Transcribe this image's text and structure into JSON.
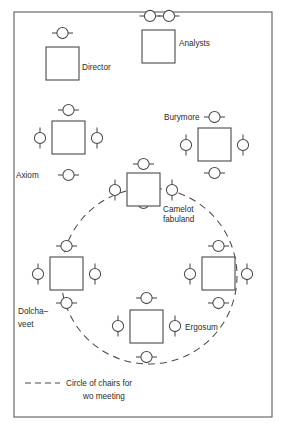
{
  "diagram": {
    "frame": {
      "x": 14,
      "y": 12,
      "width": 258,
      "height": 405
    },
    "colors": {
      "line": "#4a4a4a",
      "frame": "#5c5c5c",
      "text": "#2b2b2b",
      "background": "#ffffff"
    },
    "symbols": {
      "desk": "desk-square",
      "chair": "chair-circle-with-bar",
      "meeting_circle": "dashed-circle"
    },
    "meeting_circle": {
      "cx": 149,
      "cy": 276,
      "r": 88
    },
    "workstations": [
      {
        "id": "director",
        "label": "Director",
        "label_x": 82,
        "label_y": 70,
        "desk": {
          "x": 46,
          "y": 47,
          "width": 33,
          "height": 33
        },
        "chairs": [
          {
            "side": "top",
            "x": 62.5,
            "y": 33
          }
        ]
      },
      {
        "id": "analysts",
        "label": "Analysts",
        "label_x": 179,
        "label_y": 46,
        "desk": {
          "x": 142,
          "y": 30,
          "width": 33,
          "height": 33
        },
        "chairs": [
          {
            "side": "top",
            "x": 150,
            "y": 16
          },
          {
            "side": "top",
            "x": 169,
            "y": 16
          }
        ]
      },
      {
        "id": "axiom",
        "label": "Axiom",
        "label_x": 16,
        "label_y": 178,
        "desk": {
          "x": 52,
          "y": 121,
          "width": 33,
          "height": 33
        },
        "chairs": [
          {
            "side": "top",
            "x": 68.5,
            "y": 110
          },
          {
            "side": "left",
            "x": 40,
            "y": 138
          },
          {
            "side": "right",
            "x": 97,
            "y": 138
          },
          {
            "side": "bottom",
            "x": 68.5,
            "y": 175
          }
        ]
      },
      {
        "id": "burymore",
        "label": "Burymore",
        "label_x": 164,
        "label_y": 120,
        "desk": {
          "x": 198,
          "y": 128,
          "width": 33,
          "height": 33
        },
        "chairs": [
          {
            "side": "top",
            "x": 214.5,
            "y": 117
          },
          {
            "side": "left",
            "x": 186,
            "y": 145
          },
          {
            "side": "right",
            "x": 243,
            "y": 145
          },
          {
            "side": "bottom",
            "x": 214.5,
            "y": 173
          }
        ]
      },
      {
        "id": "camelot-fabuland",
        "label": "Camelot",
        "label2": "fabuland",
        "label_x": 163,
        "label_y": 212,
        "label2_y": 222,
        "desk": {
          "x": 127,
          "y": 173,
          "width": 33,
          "height": 33
        },
        "chairs": [
          {
            "side": "top",
            "x": 143.5,
            "y": 164
          },
          {
            "side": "left",
            "x": 115,
            "y": 190
          },
          {
            "side": "right",
            "x": 172,
            "y": 190
          },
          {
            "side": "bottom",
            "x": 143.5,
            "y": 203
          }
        ]
      },
      {
        "id": "dolcha-veet",
        "label": "Dolcha–",
        "label2": "veet",
        "label_x": 18,
        "label_y": 314,
        "label2_y": 327,
        "desk": {
          "x": 50,
          "y": 257,
          "width": 33,
          "height": 33
        },
        "chairs": [
          {
            "side": "top",
            "x": 66.5,
            "y": 246
          },
          {
            "side": "left",
            "x": 38,
            "y": 274
          },
          {
            "side": "right",
            "x": 95,
            "y": 274
          },
          {
            "side": "bottom",
            "x": 66.5,
            "y": 303
          }
        ]
      },
      {
        "id": "ergosum",
        "label": "Ergosum",
        "label_x": 185,
        "label_y": 330,
        "desk": {
          "x": 130,
          "y": 310,
          "width": 33,
          "height": 33
        },
        "chairs": [
          {
            "side": "top",
            "x": 146.5,
            "y": 298
          },
          {
            "side": "left",
            "x": 118,
            "y": 326
          },
          {
            "side": "right",
            "x": 175,
            "y": 326
          },
          {
            "side": "bottom",
            "x": 146.5,
            "y": 357
          }
        ]
      },
      {
        "id": "unnamed-right",
        "label": "",
        "desk": {
          "x": 202,
          "y": 257,
          "width": 33,
          "height": 33
        },
        "chairs": [
          {
            "side": "top",
            "x": 218.5,
            "y": 246
          },
          {
            "side": "left",
            "x": 190,
            "y": 274
          },
          {
            "side": "right",
            "x": 247,
            "y": 274
          },
          {
            "side": "bottom",
            "x": 218.5,
            "y": 303
          }
        ]
      }
    ],
    "legend": {
      "dash_x1": 25,
      "dash_x2": 60,
      "dash_y": 383,
      "line1": "Circle of chairs for",
      "line1_x": 66,
      "line1_y": 386,
      "line2": "wo meeting",
      "line2_x": 83,
      "line2_y": 399
    }
  }
}
